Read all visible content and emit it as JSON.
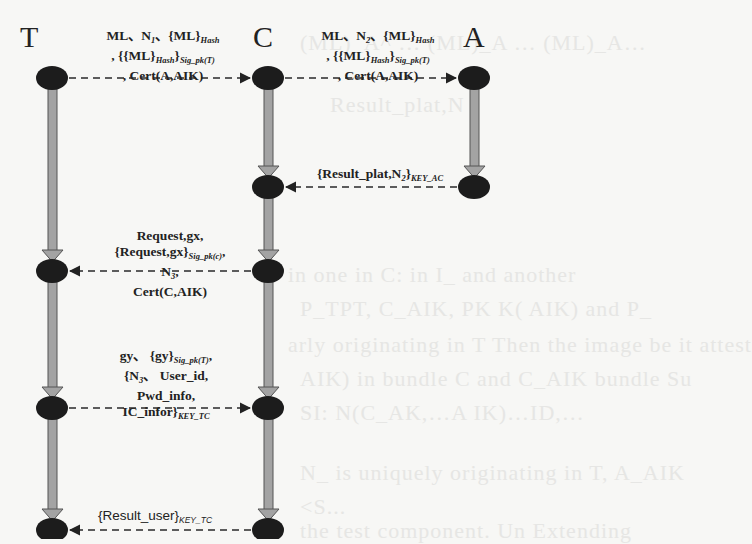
{
  "diagram": {
    "type": "sequence",
    "actors": [
      {
        "id": "T",
        "label": "T",
        "x": 52
      },
      {
        "id": "C",
        "label": "C",
        "x": 268
      },
      {
        "id": "A",
        "label": "A",
        "x": 474
      }
    ],
    "messages": [
      {
        "from": "T",
        "to": "C",
        "y": 78,
        "lines": [
          "ML, N1, {ML}Hash",
          ", {{ML}Hash}Sig_pk(T)",
          ", Cert(A,AIK)"
        ],
        "line1": "ML、N",
        "line1_sub": "1",
        "line1_b": "、{ML}",
        "line1_sub2": "Hash",
        "line2_a": ", {{ML}",
        "line2_sub1": "Hash",
        "line2_b": "}",
        "line2_sub2": "Sig_pk(T)",
        "line3": ", Cert(A,AIK)"
      },
      {
        "from": "C",
        "to": "A",
        "y": 78,
        "lines": [
          "ML, N2, {ML}Hash",
          ", {{ML}Hash}Sig_pk(T)",
          ", Cert(A,AIK)"
        ],
        "line1": "ML、N",
        "line1_sub": "2",
        "line1_b": "、{ML}",
        "line1_sub2": "Hash",
        "line2_a": ", {{ML}",
        "line2_sub1": "Hash",
        "line2_b": "}",
        "line2_sub2": "Sig_pk(T)",
        "line3": ", Cert(A,AIK)"
      },
      {
        "from": "A",
        "to": "C",
        "y": 187,
        "text": "{Result_plat,N2}KEY_AC",
        "main": "{Result_plat,N",
        "sub": "2",
        "close": "}",
        "key": "KEY_AC"
      },
      {
        "from": "C",
        "to": "T",
        "y": 271,
        "lines": [
          "Request,gx,",
          "{Request,gx}Sig_pk(c),",
          "N3,",
          "Cert(C,AIK)"
        ],
        "line1": "Request,gx,",
        "line2_a": "{Request,gx}",
        "line2_sub": "Sig_pk(c)",
        "line2_b": ",",
        "line3_a": "N",
        "line3_sub": "3",
        "line3_b": ",",
        "line4": "Cert(C,AIK)"
      },
      {
        "from": "T",
        "to": "C",
        "y": 408,
        "lines": [
          "gy, {gy}Sig_pk(T),",
          "{N3, User_id,",
          "Pwd_info,",
          "IC_infor}KEY_TC"
        ],
        "line1_a": "gy、 {gy}",
        "line1_sub": "Sig_pk(T)",
        "line1_b": ",",
        "line2_a": "{N",
        "line2_sub": "3",
        "line2_b": "、 User_id,",
        "line3": "Pwd_info,",
        "line4_a": "IC_infor}",
        "line4_sub": "KEY_TC"
      },
      {
        "from": "C",
        "to": "T",
        "y": 530,
        "text": "{Result_user}KEY_TC",
        "main": "{Result_user}",
        "key": "KEY_TC"
      }
    ],
    "nodes": {
      "T": [
        78,
        271,
        408,
        530
      ],
      "C": [
        78,
        187,
        271,
        408,
        530
      ],
      "A": [
        78,
        187
      ]
    },
    "colors": {
      "node": "#1c1c1c",
      "shaft": "#a3a3a3",
      "shaft_outline": "#555555",
      "dashed_arrow": "#2a2a2a",
      "background": "#f7f7f5"
    },
    "background_bleed_lines": [
      "(ML)_A^ … (ML)_A … (ML)_A…",
      "Result_plat,N",
      "in one in C: in I_  and another",
      "P_TPT, C_AIK, PK  K( AIK) and P_",
      "arly originating in T  Then the image be it attest",
      "AIK) in bundle C and C_AIK bundle  Su",
      "SI: N(C_AK,…A IK)…ID,…",
      "N_ is uniquely originating in T, A_AIK",
      "<S...",
      "the test component. Un Extending"
    ]
  }
}
